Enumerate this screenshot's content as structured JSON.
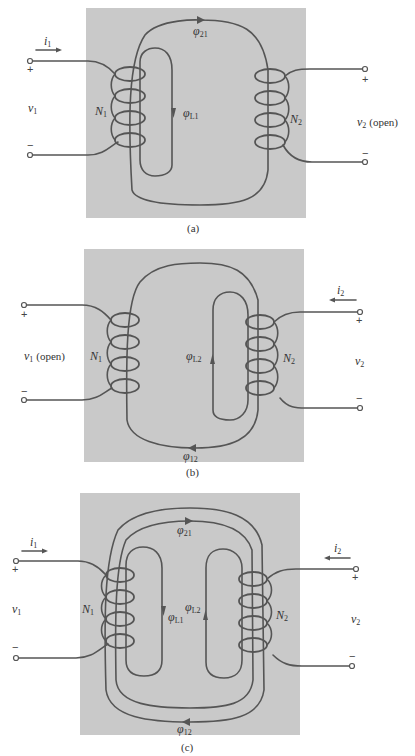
{
  "figure": {
    "panels": [
      {
        "id": "a",
        "caption": "(a)",
        "left_winding": "N",
        "left_winding_sub": "1",
        "right_winding": "N",
        "right_winding_sub": "2",
        "left_voltage": "v",
        "left_voltage_sub": "1",
        "left_voltage_suffix": "",
        "right_voltage": "v",
        "right_voltage_sub": "2",
        "right_voltage_suffix": "(open)",
        "current": "i",
        "current_sub": "1",
        "mutual_flux": "φ",
        "mutual_flux_sub": "21",
        "leakage_flux": "φ",
        "leakage_flux_sub": "L1",
        "plus": "+",
        "minus": "−"
      },
      {
        "id": "b",
        "caption": "(b)",
        "left_winding": "N",
        "left_winding_sub": "1",
        "right_winding": "N",
        "right_winding_sub": "2",
        "left_voltage": "v",
        "left_voltage_sub": "1",
        "left_voltage_suffix": "(open)",
        "right_voltage": "v",
        "right_voltage_sub": "2",
        "right_voltage_suffix": "",
        "current": "i",
        "current_sub": "2",
        "mutual_flux": "φ",
        "mutual_flux_sub": "12",
        "leakage_flux": "φ",
        "leakage_flux_sub": "L2",
        "plus": "+",
        "minus": "−"
      },
      {
        "id": "c",
        "caption": "(c)",
        "left_winding": "N",
        "left_winding_sub": "1",
        "right_winding": "N",
        "right_winding_sub": "2",
        "left_voltage": "v",
        "left_voltage_sub": "1",
        "right_voltage": "v",
        "right_voltage_sub": "2",
        "current_left": "i",
        "current_left_sub": "1",
        "current_right": "i",
        "current_right_sub": "2",
        "mutual_flux_top": "φ",
        "mutual_flux_top_sub": "21",
        "mutual_flux_bottom": "φ",
        "mutual_flux_bottom_sub": "12",
        "leakage_flux_left": "φ",
        "leakage_flux_left_sub": "L1",
        "leakage_flux_right": "φ",
        "leakage_flux_right_sub": "L2",
        "plus": "+",
        "minus": "−"
      }
    ],
    "colors": {
      "core": "#c9c9c9",
      "line": "#555555",
      "background": "#ffffff"
    }
  }
}
